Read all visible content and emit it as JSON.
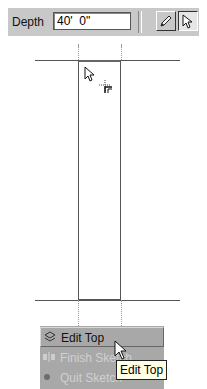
{
  "toolbar": {
    "depth_label": "Depth",
    "depth_value": "40'  0\"",
    "tools": [
      {
        "name": "pencil-icon",
        "label": "Draw"
      },
      {
        "name": "arrow-select-icon",
        "label": "Select",
        "pressed": true
      }
    ]
  },
  "canvas": {
    "shape": "rectangle",
    "cursor": "arrow-icon",
    "snap_cursor": "crosshair-corner-icon"
  },
  "menu": {
    "items": [
      {
        "label": "Edit Top",
        "icon": "edit-top-icon",
        "state": "hover"
      },
      {
        "label": "Finish Sketch",
        "icon": "finish-sketch-icon",
        "state": "disabled",
        "visible_text": "Finish Ske"
      },
      {
        "label": "Quit Sketch",
        "icon": "quit-sketch-icon",
        "state": "partial"
      }
    ]
  },
  "tooltip": {
    "text": "Edit Top"
  },
  "colors": {
    "toolbar_bg": "#c8c8c8",
    "menu_bg": "#a8a8a8",
    "tooltip_bg": "#ffffe8",
    "line": "#555555"
  }
}
